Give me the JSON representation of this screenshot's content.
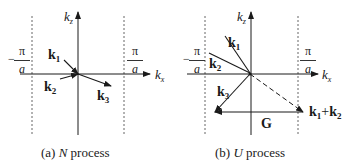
{
  "panels": [
    {
      "id": "a",
      "caption_prefix": "(a) ",
      "caption_letter": "N",
      "caption_suffix": " process",
      "axis_x": "k",
      "axis_x_sub": "x",
      "axis_z": "k",
      "axis_z_sub": "z",
      "bound_left_num": "π",
      "bound_left_den": "a",
      "bound_left_sign": "−",
      "bound_right_num": "π",
      "bound_right_den": "a",
      "vectors": [
        {
          "name": "k",
          "sub": "1"
        },
        {
          "name": "k",
          "sub": "2"
        },
        {
          "name": "k",
          "sub": "3"
        }
      ]
    },
    {
      "id": "b",
      "caption_prefix": "(b) ",
      "caption_letter": "U",
      "caption_suffix": " process",
      "axis_x": "k",
      "axis_x_sub": "x",
      "axis_z": "k",
      "axis_z_sub": "z",
      "bound_left_num": "π",
      "bound_left_den": "a",
      "bound_left_sign": "−",
      "bound_right_num": "π",
      "bound_right_den": "a",
      "vectors": [
        {
          "name": "k",
          "sub": "1"
        },
        {
          "name": "k",
          "sub": "2"
        },
        {
          "name": "k",
          "sub": "3"
        }
      ],
      "sum_label": {
        "a": "k",
        "a_sub": "1",
        "plus": "+",
        "b": "k",
        "b_sub": "2"
      },
      "reciprocal_vector": "G"
    }
  ]
}
